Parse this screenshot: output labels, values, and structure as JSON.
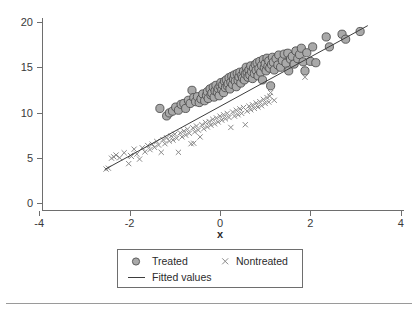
{
  "figure": {
    "width": 418,
    "height": 313,
    "background": "#ffffff",
    "footer_rule_color": "#9a9a9a"
  },
  "chart_data": {
    "type": "scatter",
    "title": "",
    "xlabel": "x",
    "ylabel": "",
    "xlim": [
      -4.4,
      4.1
    ],
    "ylim": [
      0,
      21
    ],
    "xticks": [
      -4,
      -2,
      0,
      2,
      4
    ],
    "xtick_labels": [
      "-4",
      "-2",
      "0",
      "2",
      "4"
    ],
    "yticks": [
      0,
      5,
      10,
      15,
      20
    ],
    "ytick_labels": [
      "0",
      "5",
      "10",
      "15",
      "20"
    ],
    "grid": false,
    "legend_position": "below-plot",
    "series": [
      {
        "name": "Treated",
        "marker": "circle",
        "marker_fill": "#a9a9a9",
        "marker_stroke": "#4f4f4f",
        "marker_size": 8.2,
        "points": [
          [
            -1.33,
            10.45
          ],
          [
            -1.18,
            9.62
          ],
          [
            -1.12,
            9.95
          ],
          [
            -1.05,
            10.15
          ],
          [
            -0.98,
            10.6
          ],
          [
            -0.92,
            10.25
          ],
          [
            -0.86,
            10.9
          ],
          [
            -0.8,
            11.0
          ],
          [
            -0.76,
            10.45
          ],
          [
            -0.7,
            11.35
          ],
          [
            -0.66,
            11.0
          ],
          [
            -0.62,
            12.45
          ],
          [
            -0.58,
            11.65
          ],
          [
            -0.54,
            11.2
          ],
          [
            -0.5,
            11.75
          ],
          [
            -0.46,
            11.1
          ],
          [
            -0.42,
            11.5
          ],
          [
            -0.38,
            12.05
          ],
          [
            -0.34,
            11.3
          ],
          [
            -0.3,
            11.9
          ],
          [
            -0.28,
            12.3
          ],
          [
            -0.26,
            11.55
          ],
          [
            -0.22,
            12.6
          ],
          [
            -0.2,
            11.95
          ],
          [
            -0.18,
            12.15
          ],
          [
            -0.15,
            12.8
          ],
          [
            -0.13,
            11.7
          ],
          [
            -0.11,
            12.4
          ],
          [
            -0.09,
            13.0
          ],
          [
            -0.06,
            12.25
          ],
          [
            -0.04,
            12.65
          ],
          [
            -0.02,
            11.85
          ],
          [
            0.0,
            12.9
          ],
          [
            0.02,
            13.3
          ],
          [
            0.04,
            12.5
          ],
          [
            0.06,
            13.05
          ],
          [
            0.08,
            12.2
          ],
          [
            0.1,
            13.45
          ],
          [
            0.12,
            12.75
          ],
          [
            0.14,
            13.6
          ],
          [
            0.16,
            12.95
          ],
          [
            0.18,
            13.2
          ],
          [
            0.2,
            13.85
          ],
          [
            0.22,
            12.6
          ],
          [
            0.24,
            13.35
          ],
          [
            0.26,
            14.0
          ],
          [
            0.28,
            13.1
          ],
          [
            0.3,
            13.7
          ],
          [
            0.32,
            14.15
          ],
          [
            0.34,
            13.45
          ],
          [
            0.36,
            12.85
          ],
          [
            0.38,
            14.3
          ],
          [
            0.4,
            13.55
          ],
          [
            0.42,
            13.95
          ],
          [
            0.44,
            14.45
          ],
          [
            0.46,
            13.25
          ],
          [
            0.48,
            14.1
          ],
          [
            0.5,
            13.8
          ],
          [
            0.52,
            14.55
          ],
          [
            0.54,
            13.6
          ],
          [
            0.56,
            14.25
          ],
          [
            0.58,
            15.0
          ],
          [
            0.6,
            14.4
          ],
          [
            0.62,
            13.9
          ],
          [
            0.64,
            14.7
          ],
          [
            0.66,
            14.15
          ],
          [
            0.68,
            15.15
          ],
          [
            0.7,
            14.5
          ],
          [
            0.72,
            13.75
          ],
          [
            0.74,
            14.9
          ],
          [
            0.76,
            14.3
          ],
          [
            0.78,
            15.3
          ],
          [
            0.8,
            14.65
          ],
          [
            0.82,
            15.5
          ],
          [
            0.84,
            14.05
          ],
          [
            0.86,
            14.85
          ],
          [
            0.88,
            15.65
          ],
          [
            0.9,
            14.45
          ],
          [
            0.92,
            15.2
          ],
          [
            0.94,
            13.6
          ],
          [
            0.96,
            15.85
          ],
          [
            0.98,
            14.95
          ],
          [
            1.0,
            15.4
          ],
          [
            1.02,
            14.6
          ],
          [
            1.04,
            16.0
          ],
          [
            1.06,
            15.1
          ],
          [
            1.08,
            15.7
          ],
          [
            1.1,
            14.9
          ],
          [
            1.12,
            12.95
          ],
          [
            1.14,
            15.3
          ],
          [
            1.16,
            16.1
          ],
          [
            1.18,
            15.55
          ],
          [
            1.2,
            14.7
          ],
          [
            1.24,
            15.95
          ],
          [
            1.28,
            15.25
          ],
          [
            1.3,
            16.35
          ],
          [
            1.34,
            15.0
          ],
          [
            1.38,
            15.75
          ],
          [
            1.42,
            16.45
          ],
          [
            1.46,
            15.45
          ],
          [
            1.5,
            16.55
          ],
          [
            1.52,
            14.6
          ],
          [
            1.56,
            15.9
          ],
          [
            1.6,
            16.2
          ],
          [
            1.64,
            15.35
          ],
          [
            1.68,
            16.8
          ],
          [
            1.72,
            15.95
          ],
          [
            1.76,
            16.4
          ],
          [
            1.8,
            17.1
          ],
          [
            1.84,
            15.6
          ],
          [
            1.88,
            14.6
          ],
          [
            1.92,
            16.6
          ],
          [
            2.0,
            15.65
          ],
          [
            2.05,
            17.25
          ],
          [
            2.12,
            15.5
          ],
          [
            2.35,
            18.35
          ],
          [
            2.42,
            17.25
          ],
          [
            2.7,
            18.65
          ],
          [
            2.78,
            18.1
          ],
          [
            3.1,
            18.95
          ]
        ]
      },
      {
        "name": "Nontreated",
        "marker": "x",
        "marker_stroke": "#8a8a8a",
        "marker_size": 5.2,
        "points": [
          [
            -2.52,
            3.75
          ],
          [
            -2.47,
            3.85
          ],
          [
            -2.35,
            5.1
          ],
          [
            -2.3,
            5.3
          ],
          [
            -2.22,
            5.0
          ],
          [
            -2.12,
            5.55
          ],
          [
            -2.02,
            4.35
          ],
          [
            -1.96,
            5.15
          ],
          [
            -1.9,
            5.95
          ],
          [
            -1.84,
            5.4
          ],
          [
            -1.78,
            4.85
          ],
          [
            -1.72,
            6.1
          ],
          [
            -1.66,
            5.65
          ],
          [
            -1.6,
            6.35
          ],
          [
            -1.55,
            5.9
          ],
          [
            -1.5,
            6.5
          ],
          [
            -1.45,
            6.15
          ],
          [
            -1.4,
            6.8
          ],
          [
            -1.36,
            6.4
          ],
          [
            -1.3,
            5.6
          ],
          [
            -1.26,
            7.0
          ],
          [
            -1.22,
            6.55
          ],
          [
            -1.18,
            7.2
          ],
          [
            -1.12,
            6.85
          ],
          [
            -1.08,
            7.4
          ],
          [
            -1.04,
            6.95
          ],
          [
            -1.0,
            7.6
          ],
          [
            -0.96,
            7.15
          ],
          [
            -0.92,
            5.6
          ],
          [
            -0.88,
            7.75
          ],
          [
            -0.84,
            7.3
          ],
          [
            -0.8,
            7.95
          ],
          [
            -0.76,
            7.5
          ],
          [
            -0.72,
            8.15
          ],
          [
            -0.68,
            7.7
          ],
          [
            -0.64,
            6.55
          ],
          [
            -0.6,
            8.3
          ],
          [
            -0.56,
            7.85
          ],
          [
            -0.52,
            8.5
          ],
          [
            -0.48,
            8.05
          ],
          [
            -0.44,
            7.3
          ],
          [
            -0.4,
            8.65
          ],
          [
            -0.36,
            8.2
          ],
          [
            -0.32,
            8.9
          ],
          [
            -0.28,
            8.4
          ],
          [
            -0.24,
            9.0
          ],
          [
            -0.2,
            8.6
          ],
          [
            -0.16,
            9.25
          ],
          [
            -0.12,
            8.75
          ],
          [
            -0.08,
            9.4
          ],
          [
            -0.04,
            8.95
          ],
          [
            0.0,
            9.6
          ],
          [
            0.04,
            9.15
          ],
          [
            0.08,
            9.75
          ],
          [
            0.12,
            9.3
          ],
          [
            0.16,
            9.9
          ],
          [
            0.2,
            9.45
          ],
          [
            0.24,
            8.35
          ],
          [
            0.28,
            10.05
          ],
          [
            0.32,
            9.6
          ],
          [
            0.36,
            10.25
          ],
          [
            0.4,
            9.75
          ],
          [
            0.44,
            10.4
          ],
          [
            0.48,
            9.9
          ],
          [
            0.52,
            10.55
          ],
          [
            0.56,
            8.65
          ],
          [
            0.6,
            10.15
          ],
          [
            0.64,
            10.7
          ],
          [
            0.68,
            10.3
          ],
          [
            0.72,
            10.85
          ],
          [
            0.76,
            10.45
          ],
          [
            0.8,
            11.05
          ],
          [
            0.84,
            10.6
          ],
          [
            0.88,
            11.2
          ],
          [
            0.92,
            10.75
          ],
          [
            0.96,
            11.45
          ],
          [
            1.0,
            11.0
          ],
          [
            1.04,
            11.65
          ],
          [
            1.08,
            11.15
          ],
          [
            1.12,
            12.2
          ],
          [
            1.2,
            11.35
          ],
          [
            -0.58,
            6.6
          ],
          [
            -1.98,
            5.25
          ],
          [
            -2.4,
            4.95
          ],
          [
            1.88,
            13.9
          ],
          [
            1.1,
            11.8
          ]
        ]
      }
    ],
    "fitted_line": {
      "name": "Fitted values",
      "color": "#3d3d3d",
      "x_start": -2.55,
      "y_start": 3.7,
      "x_end": 3.27,
      "y_end": 19.6
    }
  },
  "legend": {
    "entries": [
      {
        "label": "Treated",
        "marker": "circle-marker-icon"
      },
      {
        "label": "Nontreated",
        "marker": "cross-marker-icon"
      },
      {
        "label": "Fitted values",
        "marker": "line-marker-icon"
      }
    ]
  }
}
